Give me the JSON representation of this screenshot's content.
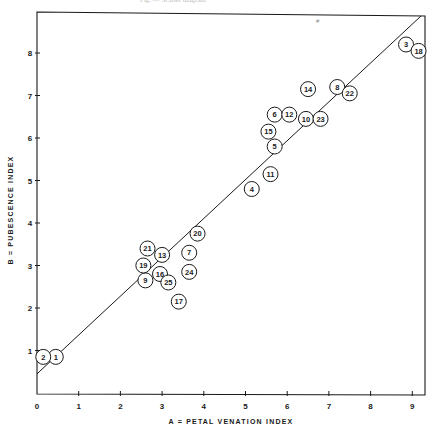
{
  "header": {
    "caption": "Fig. — Scatter diagram"
  },
  "chart_data": {
    "type": "scatter",
    "title": "",
    "xlabel": "A = PETAL VENATION INDEX",
    "ylabel": "B = PUBESCENCE INDEX",
    "xlim": [
      0,
      9.3
    ],
    "ylim": [
      0,
      9.2
    ],
    "x_ticks": [
      0,
      1,
      2,
      3,
      4,
      5,
      6,
      7,
      8,
      9
    ],
    "y_ticks": [
      1,
      2,
      3,
      4,
      5,
      6,
      7,
      8
    ],
    "grid": false,
    "legend": null,
    "marker": "open circle with numeric label",
    "points": [
      {
        "label": "1",
        "x": 0.45,
        "y": 0.85
      },
      {
        "label": "2",
        "x": 0.15,
        "y": 0.85
      },
      {
        "label": "3",
        "x": 8.85,
        "y": 8.2
      },
      {
        "label": "4",
        "x": 5.15,
        "y": 4.8
      },
      {
        "label": "5",
        "x": 5.7,
        "y": 5.8
      },
      {
        "label": "6",
        "x": 5.7,
        "y": 6.55
      },
      {
        "label": "7",
        "x": 3.65,
        "y": 3.3
      },
      {
        "label": "8",
        "x": 7.2,
        "y": 7.2
      },
      {
        "label": "9",
        "x": 2.6,
        "y": 2.65
      },
      {
        "label": "10",
        "x": 6.45,
        "y": 6.45
      },
      {
        "label": "11",
        "x": 5.6,
        "y": 5.15
      },
      {
        "label": "12",
        "x": 6.05,
        "y": 6.55
      },
      {
        "label": "13",
        "x": 3.0,
        "y": 3.25
      },
      {
        "label": "14",
        "x": 6.5,
        "y": 7.15
      },
      {
        "label": "15",
        "x": 5.55,
        "y": 6.15
      },
      {
        "label": "16",
        "x": 2.95,
        "y": 2.8
      },
      {
        "label": "17",
        "x": 3.4,
        "y": 2.15
      },
      {
        "label": "18",
        "x": 9.15,
        "y": 8.05
      },
      {
        "label": "19",
        "x": 2.55,
        "y": 3.0
      },
      {
        "label": "20",
        "x": 3.85,
        "y": 3.75
      },
      {
        "label": "21",
        "x": 2.65,
        "y": 3.4
      },
      {
        "label": "22",
        "x": 7.5,
        "y": 7.05
      },
      {
        "label": "23",
        "x": 6.8,
        "y": 6.45
      },
      {
        "label": "24",
        "x": 3.65,
        "y": 2.85
      },
      {
        "label": "25",
        "x": 3.15,
        "y": 2.6
      }
    ],
    "fit_line": {
      "x0": 0,
      "y0": 0.45,
      "x1": 9.3,
      "y1": 8.95
    }
  },
  "colors": {
    "ink": "#1a1a1a",
    "background": "#ffffff"
  }
}
